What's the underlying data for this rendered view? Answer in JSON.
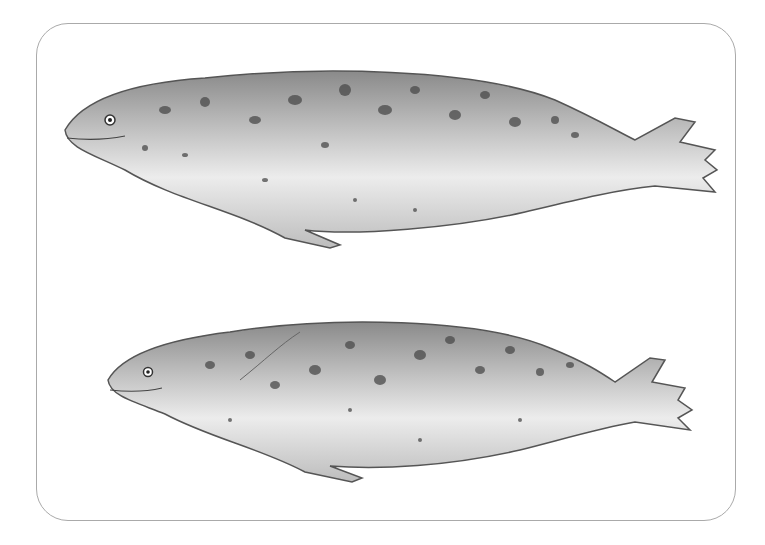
{
  "figure": {
    "type": "illustration",
    "frame": {
      "border_color": "#aaaaaa",
      "background": "#ffffff"
    },
    "seals": [
      {
        "position": "top",
        "facing": "left"
      },
      {
        "position": "bottom",
        "facing": "left"
      }
    ]
  }
}
